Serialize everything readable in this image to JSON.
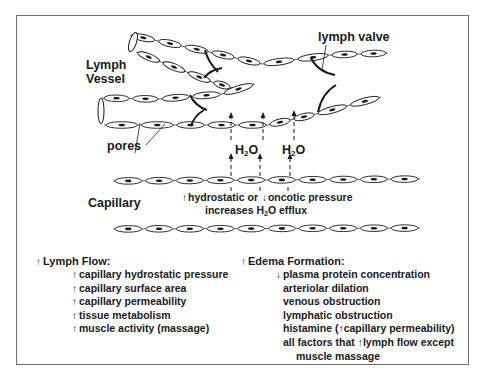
{
  "diagram": {
    "labels": {
      "lymph_vessel_line1": "Lymph",
      "lymph_vessel_line2": "Vessel",
      "lymph_valve": "lymph valve",
      "pores": "pores",
      "capillary": "Capillary",
      "h2o_left": "H",
      "h2o_left_sub": "2",
      "h2o_left_tail": "O",
      "h2o_right": "H",
      "h2o_right_sub": "2",
      "h2o_right_tail": "O"
    },
    "caption": {
      "up_arrow": "↑",
      "line1_a": "hydrostatic or ",
      "down_arrow": "↓",
      "line1_b": "oncotic pressure",
      "line2_a": "increases H",
      "line2_sub": "2",
      "line2_b": "O efflux"
    },
    "colors": {
      "ink": "#1a1a1a",
      "frame": "#6e6e6e",
      "cell_fill": "#ffffff"
    }
  },
  "lymph_flow": {
    "title_arrow": "↑",
    "title": "Lymph Flow:",
    "items": [
      {
        "arrow": "↑",
        "text": "capillary hydrostatic pressure"
      },
      {
        "arrow": "↑",
        "text": "capillary surface area"
      },
      {
        "arrow": "↑",
        "text": "capillary permeability"
      },
      {
        "arrow": "↑",
        "text": "tissue metabolism"
      },
      {
        "arrow": "↑",
        "text": "muscle activity (massage)"
      }
    ]
  },
  "edema_formation": {
    "title_arrow": "↑",
    "title": "Edema Formation:",
    "items": [
      {
        "arrow": "↓",
        "text": "plasma protein concentration"
      },
      {
        "arrow": "",
        "text": "arteriolar dilation"
      },
      {
        "arrow": "",
        "text": "venous obstruction"
      },
      {
        "arrow": "",
        "text": "lymphatic obstruction"
      },
      {
        "arrow": "",
        "text": "histamine (↑capillary permeability)"
      },
      {
        "arrow": "",
        "text": "all factors that ↑lymph flow except"
      },
      {
        "arrow": "",
        "text": "muscle massage",
        "indent": true
      }
    ]
  },
  "geometry": {
    "chains": [
      {
        "name": "upper-vessel-top-wall",
        "pts": [
          [
            130,
            35
          ],
          [
            210,
            52
          ],
          [
            262,
            64
          ],
          [
            330,
            55
          ],
          [
            388,
            53
          ]
        ]
      },
      {
        "name": "upper-vessel-bottom-wall",
        "pts": [
          [
            136,
            52
          ],
          [
            212,
            82
          ],
          [
            232,
            88
          ]
        ]
      },
      {
        "name": "lower-vessel-top-wall",
        "pts": [
          [
            102,
            98
          ],
          [
            160,
            99
          ],
          [
            222,
            94
          ],
          [
            255,
            84
          ]
        ]
      },
      {
        "name": "lower-vessel-bottom-wall",
        "pts": [
          [
            104,
            125
          ],
          [
            175,
            125
          ],
          [
            268,
            125
          ],
          [
            316,
            114
          ],
          [
            381,
            97
          ]
        ]
      },
      {
        "name": "capillary-top-wall",
        "pts": [
          [
            113,
            181
          ],
          [
            420,
            179
          ]
        ]
      },
      {
        "name": "capillary-bottom-wall",
        "pts": [
          [
            113,
            229
          ],
          [
            420,
            228
          ]
        ]
      }
    ],
    "cell_len": 28,
    "cell_h": 6.5
  }
}
